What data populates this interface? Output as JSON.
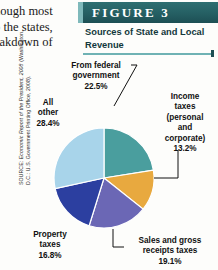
{
  "body_text": {
    "lines": [
      "hough most",
      "o the states,",
      "eakdown of"
    ]
  },
  "source_note": {
    "prefix": "SOURCE: ",
    "italic_title": "Economic Report of the President, 2008",
    "suffix": " (Washington, D.C.: U.S. Government Printing Office, 2008)."
  },
  "figure": {
    "banner_label": "FIGURE  3",
    "title": "Sources of State and Local Revenue",
    "colors": {
      "banner_dark": "#255f63",
      "banner_accent": "#7fb9bb",
      "rule": "#6fb2b4",
      "title_text": "#12383c"
    }
  },
  "chart_data": {
    "type": "pie",
    "title": "Sources of State and Local Revenue",
    "categories": [
      "From federal government",
      "Income taxes (personal and corporate)",
      "Sales and gross receipts taxes",
      "Property taxes",
      "All other"
    ],
    "values": [
      22.5,
      13.2,
      19.1,
      16.8,
      28.4
    ],
    "value_labels": [
      "22.5%",
      "13.2%",
      "19.1%",
      "16.8%",
      "28.4%"
    ],
    "colors": [
      "#4a9e9e",
      "#e8a93f",
      "#6b67b5",
      "#2c3fa0",
      "#a8d4ea"
    ],
    "slice_border": "#ffffff",
    "start_angle_deg": 0,
    "direction": "clockwise",
    "legend": "none",
    "labels_position": "outside-with-leader-lines",
    "units": "percent",
    "total": 100.0
  },
  "labels": {
    "federal": {
      "l1": "From federal",
      "l2": "government",
      "value": "22.5%"
    },
    "income": {
      "l1": "Income",
      "l2": "taxes",
      "l3": "(personal",
      "l4": "and",
      "l5": "corporate)",
      "value": "13.2%"
    },
    "sales": {
      "l1": "Sales and gross",
      "l2": "receipts taxes",
      "value": "19.1%"
    },
    "property": {
      "l1": "Property",
      "l2": "taxes",
      "value": "16.8%"
    },
    "allother": {
      "l1": "All",
      "l2": "other",
      "value": "28.4%"
    }
  }
}
